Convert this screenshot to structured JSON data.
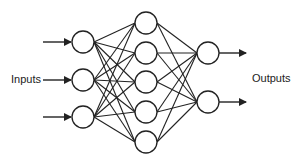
{
  "labels": {
    "inputs": "Inputs",
    "outputs": "Outputs"
  },
  "diagram": {
    "type": "feedforward-neural-network",
    "stroke_color": "#222222",
    "layers": [
      {
        "name": "input",
        "nodes": 3
      },
      {
        "name": "hidden",
        "nodes": 5
      },
      {
        "name": "output",
        "nodes": 2
      }
    ],
    "connectivity": "fully-connected"
  }
}
